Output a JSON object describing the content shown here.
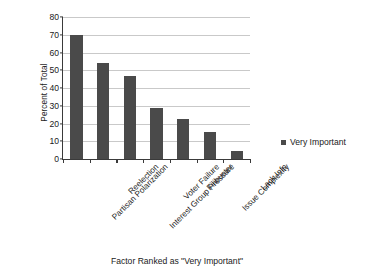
{
  "chart_data": {
    "type": "bar",
    "title": "",
    "categories": [
      "Partisan Polarization",
      "Reelection",
      "Interest Group Pressure",
      "Voter Failure",
      "Filibuster",
      "Issue Complexity",
      "Lack Info"
    ],
    "values": [
      70,
      54,
      47,
      28.5,
      22.5,
      15.5,
      4.5
    ],
    "series": [
      {
        "name": "Very Important",
        "values": [
          70,
          54,
          47,
          28.5,
          22.5,
          15.5,
          4.5
        ],
        "color": "#4a4a4a"
      }
    ],
    "xlabel": "Factor Ranked as \"Very Important\"",
    "ylabel": "Percent of Total",
    "ylim": [
      0,
      80
    ],
    "ytick_step": 10,
    "yticks": [
      "80",
      "70",
      "60",
      "50",
      "40",
      "30",
      "20",
      "10",
      "0"
    ],
    "grid": "horizontal",
    "legend_position": "right",
    "legend": [
      {
        "label": "Very Important",
        "marker": "square",
        "color": "#4a4a4a"
      }
    ]
  },
  "axes": {
    "y_title": "Percent of Total",
    "x_title": "Factor Ranked as \"Very Important\""
  },
  "colors": {
    "bar": "#4a4a4a",
    "gridline": "#c9c9c9",
    "axis": "#3a3a3a",
    "text": "#1a1a1a",
    "background": "#ffffff"
  }
}
